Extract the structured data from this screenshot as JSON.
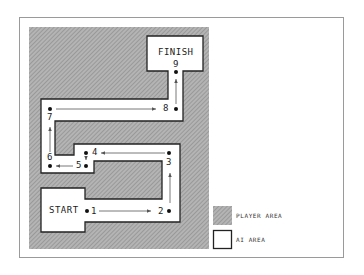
{
  "diagram": {
    "regions": {
      "start_label": "START",
      "finish_label": "FINISH"
    },
    "waypoints": [
      {
        "id": "1",
        "x": 86,
        "y": 211
      },
      {
        "id": "2",
        "x": 169,
        "y": 211
      },
      {
        "id": "3",
        "x": 169,
        "y": 152
      },
      {
        "id": "4",
        "x": 86,
        "y": 152
      },
      {
        "id": "5",
        "x": 86,
        "y": 165
      },
      {
        "id": "6",
        "x": 50,
        "y": 165
      },
      {
        "id": "7",
        "x": 50,
        "y": 108
      },
      {
        "id": "8",
        "x": 176,
        "y": 108
      },
      {
        "id": "9",
        "x": 176,
        "y": 72
      }
    ],
    "legend": [
      {
        "label": "PLAYER AREA",
        "swatch": "hatched-gray"
      },
      {
        "label": "AI AREA",
        "swatch": "white-outlined"
      }
    ],
    "colors": {
      "player_area": "#a9a9a9",
      "ai_area": "#ffffff",
      "outline": "#222222",
      "arrow": "#555555"
    }
  }
}
